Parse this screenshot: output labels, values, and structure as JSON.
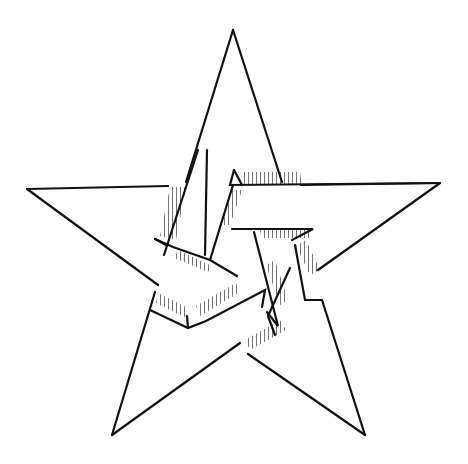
{
  "diagram": {
    "title": "Interlaced pentagram",
    "stroke_color": "#111111",
    "fill_color": "#ffffff",
    "background": "#ffffff",
    "outer_points": {
      "top": [
        233,
        30
      ],
      "left": [
        27,
        189
      ],
      "right": [
        440,
        183
      ],
      "bottom_left": [
        112,
        435
      ],
      "bottom_right": [
        365,
        435
      ]
    }
  }
}
